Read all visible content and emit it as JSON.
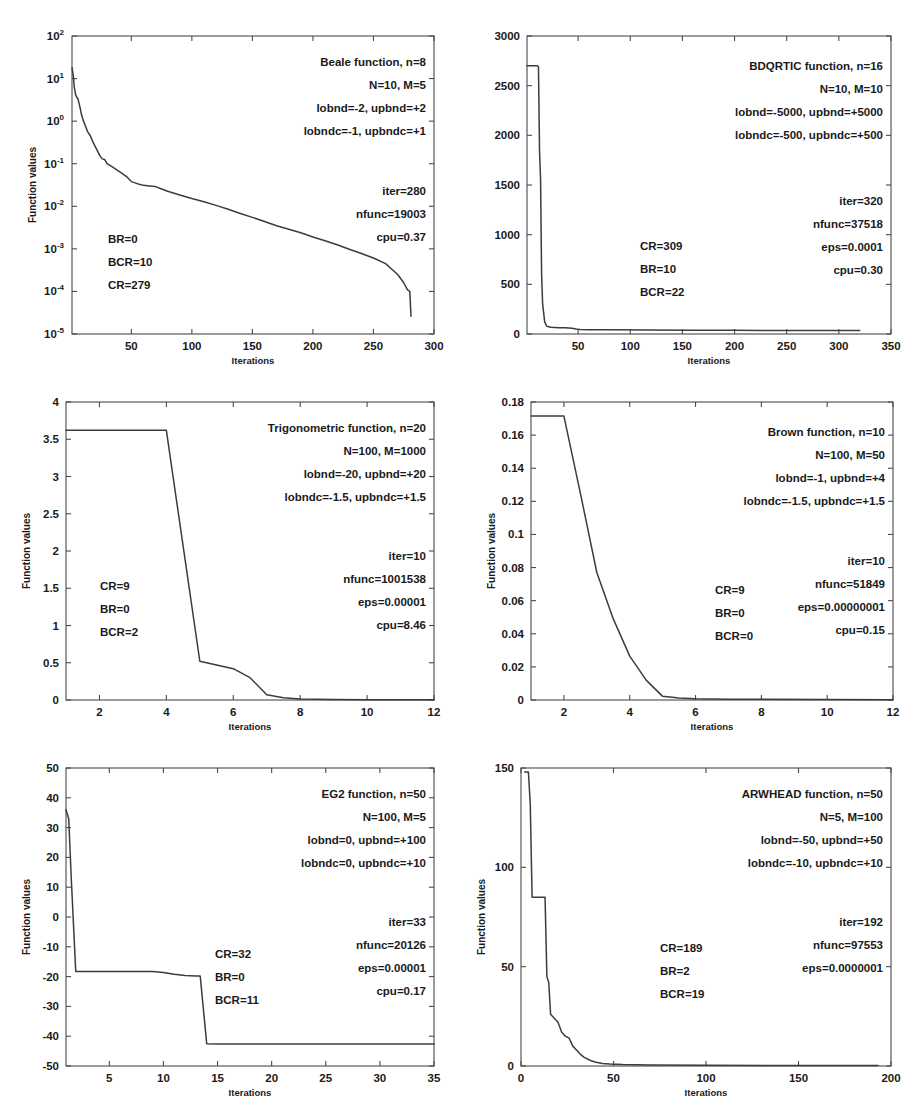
{
  "figure": {
    "background": "#ffffff",
    "line_color": "#3c3c3c",
    "axis_color": "#4a4a4a",
    "common_xlabel": "Iterations",
    "common_ylabel": "Function values"
  },
  "chart_data": [
    {
      "id": "beale",
      "type": "line",
      "title": "Beale function, n=8",
      "xlabel": "Iterations",
      "ylabel": "Function values",
      "yscale": "log",
      "xlim": [
        1,
        300
      ],
      "ylim": [
        1e-05,
        100
      ],
      "xticks": [
        50,
        100,
        150,
        200,
        250,
        300
      ],
      "xticklabels": [
        "50",
        "100",
        "150",
        "200",
        "250",
        "300"
      ],
      "yticks": [
        1e-05,
        0.0001,
        0.001,
        0.01,
        0.1,
        1,
        10,
        100
      ],
      "yticklabels": [
        "10-5",
        "10-4",
        "10-3",
        "10-2",
        "10-1",
        "100",
        "101",
        "102"
      ],
      "y_exponents": [
        -5,
        -4,
        -3,
        -2,
        -1,
        0,
        1,
        2
      ],
      "grid": false,
      "annotations_right": [
        "Beale function, n=8",
        "N=10, M=5",
        "lobnd=-2, upbnd=+2",
        "lobndc=-1, upbndc=+1"
      ],
      "annotations_right2": [
        "iter=280",
        "nfunc=19003",
        "cpu=0.37"
      ],
      "annotations_left": [
        "BR=0",
        "BCR=10",
        "CR=279"
      ],
      "params": {
        "n": 8,
        "N": 10,
        "M": 5,
        "lobnd": -2,
        "upbnd": 2,
        "lobndc": -1,
        "upbndc": 1,
        "iter": 280,
        "nfunc": 19003,
        "cpu": 0.37,
        "BR": 0,
        "BCR": 10,
        "CR": 279
      },
      "x": [
        1,
        2,
        3,
        4,
        5,
        6,
        7,
        8,
        9,
        10,
        12,
        14,
        16,
        18,
        20,
        22,
        24,
        26,
        28,
        30,
        34,
        38,
        42,
        46,
        50,
        55,
        60,
        65,
        70,
        75,
        80,
        90,
        100,
        110,
        120,
        130,
        140,
        150,
        160,
        170,
        180,
        190,
        200,
        210,
        220,
        230,
        240,
        250,
        260,
        270,
        275,
        278,
        279,
        280,
        281
      ],
      "y": [
        18,
        12,
        6,
        4.2,
        3.6,
        3.3,
        2.5,
        1.9,
        1.35,
        1.1,
        0.78,
        0.56,
        0.46,
        0.34,
        0.26,
        0.2,
        0.155,
        0.13,
        0.125,
        0.1,
        0.085,
        0.072,
        0.06,
        0.05,
        0.038,
        0.034,
        0.031,
        0.03,
        0.029,
        0.0255,
        0.0225,
        0.0185,
        0.0152,
        0.0128,
        0.0105,
        0.0085,
        0.0068,
        0.0055,
        0.0044,
        0.0035,
        0.0029,
        0.0024,
        0.0019,
        0.00155,
        0.00125,
        0.00098,
        0.00078,
        0.00061,
        0.00045,
        0.00025,
        0.00016,
        0.00011,
        0.000105,
        0.0001,
        2.6e-05
      ]
    },
    {
      "id": "bdqrtic",
      "type": "line",
      "title": "BDQRTIC function, n=16",
      "xlabel": "Iterations",
      "ylabel": "",
      "yscale": "linear",
      "xlim": [
        1,
        350
      ],
      "ylim": [
        0,
        3000
      ],
      "xticks": [
        50,
        100,
        150,
        200,
        250,
        300,
        350
      ],
      "xticklabels": [
        "50",
        "100",
        "150",
        "200",
        "250",
        "300",
        "350"
      ],
      "yticks": [
        0,
        500,
        1000,
        1500,
        2000,
        2500,
        3000
      ],
      "yticklabels": [
        "0",
        "500",
        "1000",
        "1500",
        "2000",
        "2500",
        "3000"
      ],
      "grid": false,
      "annotations_right": [
        "BDQRTIC function, n=16",
        "N=10, M=10",
        "lobnd=-5000, upbnd=+5000",
        "lobndc=-500, upbndc=+500"
      ],
      "annotations_right2": [
        "iter=320",
        "nfunc=37518",
        "eps=0.0001",
        "cpu=0.30"
      ],
      "annotations_left": [
        "CR=309",
        "BR=10",
        "BCR=22"
      ],
      "params": {
        "n": 16,
        "N": 10,
        "M": 10,
        "lobnd": -5000,
        "upbnd": 5000,
        "lobndc": -500,
        "upbndc": 500,
        "iter": 320,
        "nfunc": 37518,
        "eps": 0.0001,
        "cpu": 0.3,
        "CR": 309,
        "BR": 10,
        "BCR": 22
      },
      "x": [
        1,
        4,
        8,
        11,
        12,
        13,
        14,
        15,
        16,
        18,
        20,
        24,
        28,
        32,
        38,
        44,
        48,
        52,
        60,
        80,
        120,
        160,
        200,
        240,
        280,
        320
      ],
      "y": [
        2700,
        2700,
        2700,
        2700,
        2690,
        1850,
        1560,
        600,
        300,
        120,
        78,
        68,
        66,
        64,
        62,
        58,
        50,
        45,
        44,
        42,
        40,
        38,
        37,
        36,
        35,
        34
      ]
    },
    {
      "id": "trigonometric",
      "type": "line",
      "title": "Trigonometric function, n=20",
      "xlabel": "Iterations",
      "ylabel": "Function values",
      "yscale": "linear",
      "xlim": [
        1,
        12
      ],
      "ylim": [
        0,
        4
      ],
      "xticks": [
        2,
        4,
        6,
        8,
        10,
        12
      ],
      "xticklabels": [
        "2",
        "4",
        "6",
        "8",
        "10",
        "12"
      ],
      "yticks": [
        0,
        0.5,
        1,
        1.5,
        2,
        2.5,
        3,
        3.5,
        4
      ],
      "yticklabels": [
        "0",
        "0.5",
        "1",
        "1.5",
        "2",
        "2.5",
        "3",
        "3.5",
        "4"
      ],
      "grid": false,
      "annotations_right": [
        "Trigonometric function, n=20",
        "N=100, M=1000",
        "lobnd=-20, upbnd=+20",
        "lobndc=-1.5, upbndc=+1.5"
      ],
      "annotations_right2": [
        "iter=10",
        "nfunc=1001538",
        "eps=0.00001",
        "cpu=8.46"
      ],
      "annotations_left": [
        "CR=9",
        "BR=0",
        "BCR=2"
      ],
      "params": {
        "n": 20,
        "N": 100,
        "M": 1000,
        "lobnd": -20,
        "upbnd": 20,
        "lobndc": -1.5,
        "upbndc": 1.5,
        "iter": 10,
        "nfunc": 1001538,
        "eps": 1e-05,
        "cpu": 8.46,
        "CR": 9,
        "BR": 0,
        "BCR": 2
      },
      "x": [
        1,
        4,
        5,
        6,
        6.5,
        7,
        7.5,
        8,
        9,
        10,
        11,
        12
      ],
      "y": [
        3.62,
        3.62,
        0.52,
        0.42,
        0.3,
        0.07,
        0.03,
        0.012,
        0.006,
        0.004,
        0.003,
        0.002
      ]
    },
    {
      "id": "brown",
      "type": "line",
      "title": "Brown function, n=10",
      "xlabel": "Iterations",
      "ylabel": "Function values",
      "yscale": "linear",
      "xlim": [
        1,
        12
      ],
      "ylim": [
        0,
        0.18
      ],
      "xticks": [
        2,
        4,
        6,
        8,
        10,
        12
      ],
      "xticklabels": [
        "2",
        "4",
        "6",
        "8",
        "10",
        "12"
      ],
      "yticks": [
        0,
        0.02,
        0.04,
        0.06,
        0.08,
        0.1,
        0.12,
        0.14,
        0.16,
        0.18
      ],
      "yticklabels": [
        "0",
        "0.02",
        "0.04",
        "0.06",
        "0.08",
        "0.1",
        "0.12",
        "0.14",
        "0.16",
        "0.18"
      ],
      "grid": false,
      "annotations_right": [
        "Brown function, n=10",
        "N=100, M=50",
        "lobnd=-1, upbnd=+4",
        "lobndc=-1.5, upbndc=+1.5"
      ],
      "annotations_right2": [
        "iter=10",
        "nfunc=51849",
        "eps=0.00000001",
        "cpu=0.15"
      ],
      "annotations_left": [
        "CR=9",
        "BR=0",
        "BCR=0"
      ],
      "params": {
        "n": 10,
        "N": 100,
        "M": 50,
        "lobnd": -1,
        "upbnd": 4,
        "lobndc": -1.5,
        "upbndc": 1.5,
        "iter": 10,
        "nfunc": 51849,
        "eps": 1e-08,
        "cpu": 0.15,
        "CR": 9,
        "BR": 0,
        "BCR": 0
      },
      "x": [
        1,
        2,
        2.5,
        3,
        3.5,
        4,
        4.5,
        5,
        5.5,
        6,
        7,
        8,
        10,
        12
      ],
      "y": [
        0.1715,
        0.1715,
        0.125,
        0.077,
        0.049,
        0.0265,
        0.012,
        0.0022,
        0.0012,
        0.0008,
        0.0005,
        0.0004,
        0.0003,
        0.0002
      ]
    },
    {
      "id": "eg2",
      "type": "line",
      "title": "EG2 function, n=50",
      "xlabel": "Iterations",
      "ylabel": "Function values",
      "yscale": "linear",
      "xlim": [
        1,
        35
      ],
      "ylim": [
        -50,
        50
      ],
      "xticks": [
        5,
        10,
        15,
        20,
        25,
        30,
        35
      ],
      "xticklabels": [
        "5",
        "10",
        "15",
        "20",
        "25",
        "30",
        "35"
      ],
      "yticks": [
        -50,
        -40,
        -30,
        -20,
        -10,
        0,
        10,
        20,
        30,
        40,
        50
      ],
      "yticklabels": [
        "-50",
        "-40",
        "-30",
        "-20",
        "-10",
        "0",
        "10",
        "20",
        "30",
        "40",
        "50"
      ],
      "grid": false,
      "annotations_right": [
        "EG2 function, n=50",
        "N=100, M=5",
        "lobnd=0, upbnd=+100",
        "lobndc=0, upbndc=+10"
      ],
      "annotations_right2": [
        "iter=33",
        "nfunc=20126",
        "eps=0.00001",
        "cpu=0.17"
      ],
      "annotations_left": [
        "CR=32",
        "BR=0",
        "BCR=11"
      ],
      "params": {
        "n": 50,
        "N": 100,
        "M": 5,
        "lobnd": 0,
        "upbnd": 100,
        "lobndc": 0,
        "upbndc": 10,
        "iter": 33,
        "nfunc": 20126,
        "eps": 1e-05,
        "cpu": 0.17,
        "CR": 32,
        "BR": 0,
        "BCR": 11
      },
      "x": [
        1,
        1.25,
        1.5,
        1.9,
        2,
        3,
        9,
        10,
        11,
        12,
        13,
        13.4,
        14,
        15,
        20,
        25,
        30,
        35
      ],
      "y": [
        36,
        33,
        12,
        -18.3,
        -18.3,
        -18.3,
        -18.3,
        -18.6,
        -19.2,
        -19.6,
        -19.8,
        -19.8,
        -42.5,
        -42.6,
        -42.6,
        -42.6,
        -42.6,
        -42.6
      ]
    },
    {
      "id": "arwhead",
      "type": "line",
      "title": "ARWHEAD function, n=50",
      "xlabel": "Iterations",
      "ylabel": "Function values",
      "yscale": "linear",
      "xlim": [
        0,
        200
      ],
      "ylim": [
        0,
        150
      ],
      "xticks": [
        0,
        50,
        100,
        150,
        200
      ],
      "xticklabels": [
        "0",
        "50",
        "100",
        "150",
        "200"
      ],
      "yticks": [
        0,
        50,
        100,
        150
      ],
      "yticklabels": [
        "0",
        "50",
        "100",
        "150"
      ],
      "grid": false,
      "annotations_right": [
        "ARWHEAD function, n=50",
        "N=5, M=100",
        "lobnd=-50, upbnd=+50",
        "lobndc=-10, upbndc=+10"
      ],
      "annotations_right2": [
        "iter=192",
        "nfunc=97553",
        "eps=0.0000001"
      ],
      "annotations_left": [
        "CR=189",
        "BR=2",
        "BCR=19"
      ],
      "params": {
        "n": 50,
        "N": 5,
        "M": 100,
        "lobnd": -50,
        "upbnd": 50,
        "lobndc": -10,
        "upbndc": 10,
        "iter": 192,
        "nfunc": 97553,
        "eps": 1e-07,
        "CR": 189,
        "BR": 2,
        "BCR": 19
      },
      "x": [
        2,
        4,
        5,
        6,
        7,
        13,
        14,
        15,
        16,
        17,
        18,
        19,
        20,
        22,
        24,
        26,
        28,
        30,
        32,
        34,
        36,
        38,
        40,
        44,
        48,
        55,
        70,
        100,
        140,
        180,
        193
      ],
      "y": [
        148,
        148,
        132,
        85,
        85,
        85,
        45,
        42,
        26,
        25,
        24,
        23,
        22,
        17,
        15,
        14,
        10,
        8,
        6,
        4.5,
        3.5,
        2.6,
        2.0,
        1.3,
        1.0,
        0.7,
        0.5,
        0.35,
        0.3,
        0.25,
        0.2
      ]
    }
  ]
}
